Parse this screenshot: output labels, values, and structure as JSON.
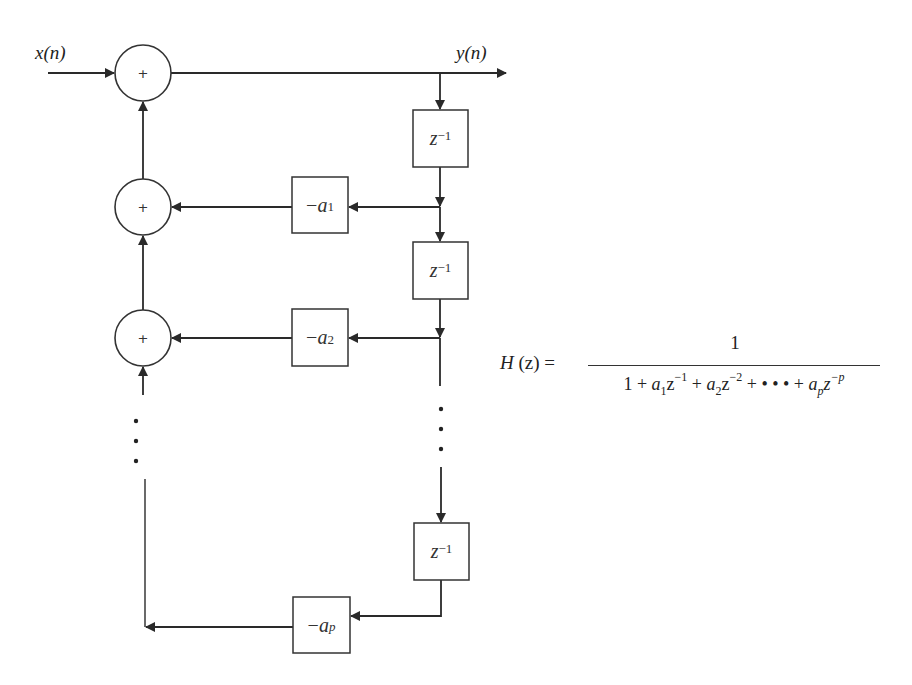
{
  "diagram": {
    "type": "all-pole IIR filter direct form block diagram",
    "input_label": "x(n)",
    "output_label": "y(n)",
    "adders": [
      {
        "id": "adder-1",
        "symbol": "+"
      },
      {
        "id": "adder-2",
        "symbol": "+"
      },
      {
        "id": "adder-3",
        "symbol": "+"
      }
    ],
    "delays": [
      {
        "id": "delay-1",
        "base": "z",
        "exp": "−1"
      },
      {
        "id": "delay-2",
        "base": "z",
        "exp": "−1"
      },
      {
        "id": "delay-3",
        "base": "z",
        "exp": "−1"
      }
    ],
    "gains": [
      {
        "id": "gain-a1",
        "sign": "−",
        "coef": "a",
        "sub": "1"
      },
      {
        "id": "gain-a2",
        "sign": "−",
        "coef": "a",
        "sub": "2"
      },
      {
        "id": "gain-ap",
        "sign": "−",
        "coef": "a",
        "sub": "p"
      }
    ],
    "ellipsis": "⋮",
    "colors": {
      "line": "#2a2a2a",
      "background": "#ffffff"
    }
  },
  "formula": {
    "lhs": "H",
    "lhs_arg": "(z) =",
    "numerator": "1",
    "denominator": {
      "t0": "1 + ",
      "a1": "a",
      "a1_sub": "1",
      "z1": "z",
      "z1_exp": "−1",
      "plus1": " + ",
      "a2": "a",
      "a2_sub": "2",
      "z2": "z",
      "z2_exp": "−2",
      "plus2": " + • • • + ",
      "ap": "a",
      "ap_sub": "p",
      "zp": "z",
      "zp_exp": "−p"
    }
  }
}
